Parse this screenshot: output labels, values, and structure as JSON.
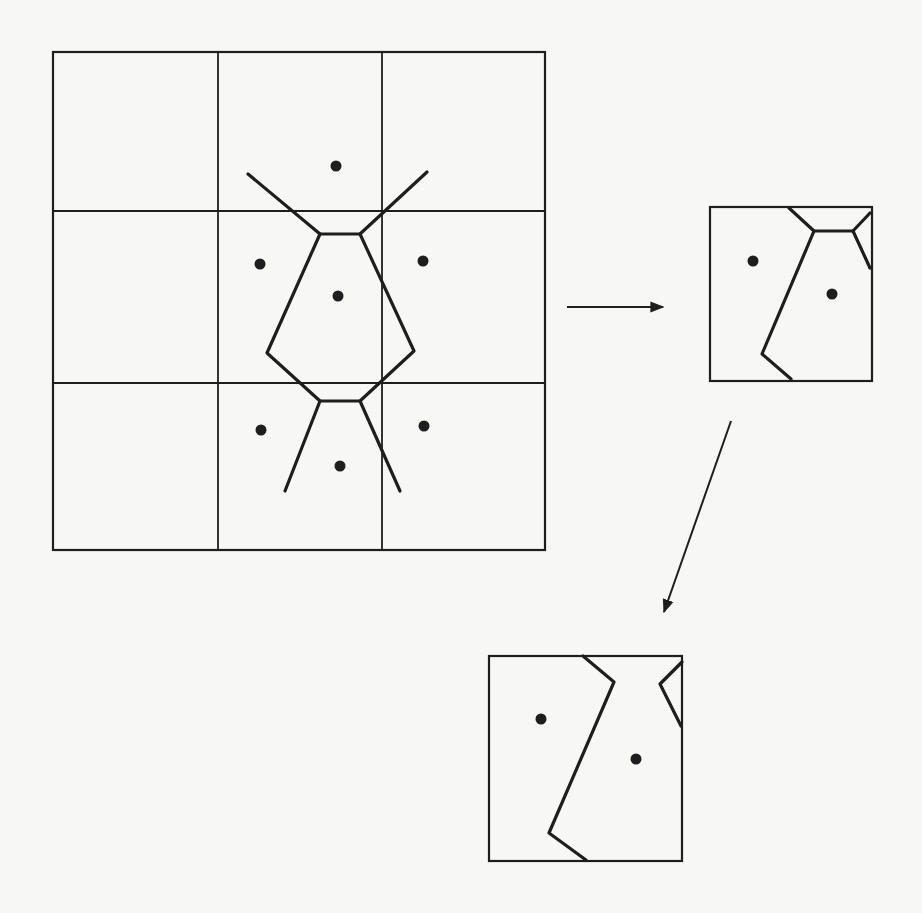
{
  "figure": {
    "type": "voronoi-tiling-diagram",
    "ink_color": "#1e1e1e",
    "background_color": "#f7f7f5"
  },
  "main_grid": {
    "outer": [
      53,
      52,
      545,
      550
    ],
    "v_lines": [
      218,
      382
    ],
    "h_lines": [
      211,
      383
    ],
    "points": [
      [
        336,
        166
      ],
      [
        260,
        264
      ],
      [
        423,
        261
      ],
      [
        338,
        296
      ],
      [
        261,
        430
      ],
      [
        424,
        426
      ],
      [
        340,
        466
      ]
    ],
    "edges": [
      [
        [
          248,
          174
        ],
        [
          320,
          234
        ],
        [
          360,
          234
        ],
        [
          427,
          172
        ]
      ],
      [
        [
          320,
          234
        ],
        [
          267,
          353
        ],
        [
          320,
          401
        ],
        [
          360,
          401
        ],
        [
          414,
          351
        ],
        [
          360,
          234
        ]
      ],
      [
        [
          320,
          401
        ],
        [
          285,
          491
        ]
      ],
      [
        [
          360,
          401
        ],
        [
          400,
          491
        ]
      ]
    ]
  },
  "arrow_right": {
    "from": [
      567,
      307
    ],
    "to": [
      663,
      307
    ]
  },
  "tile_right": {
    "outer": [
      710,
      207,
      872,
      381
    ],
    "points": [
      [
        753,
        261
      ],
      [
        832,
        294
      ]
    ],
    "edges": [
      [
        [
          789,
          208
        ],
        [
          814,
          231
        ],
        [
          853,
          231
        ],
        [
          870,
          213
        ]
      ],
      [
        [
          814,
          231
        ],
        [
          762,
          354
        ],
        [
          791,
          379
        ]
      ],
      [
        [
          853,
          231
        ],
        [
          870,
          268
        ]
      ]
    ]
  },
  "arrow_down": {
    "from": [
      731,
      421
    ],
    "to": [
      664,
      612
    ]
  },
  "tile_bottom": {
    "outer": [
      489,
      656,
      682,
      861
    ],
    "points": [
      [
        541,
        719
      ],
      [
        636,
        759
      ]
    ],
    "edges": [
      [
        [
          583,
          656
        ],
        [
          614,
          682
        ],
        [
          549,
          833
        ],
        [
          586,
          860
        ]
      ],
      [
        [
          682,
          662
        ],
        [
          660,
          684
        ],
        [
          681,
          726
        ]
      ]
    ]
  }
}
